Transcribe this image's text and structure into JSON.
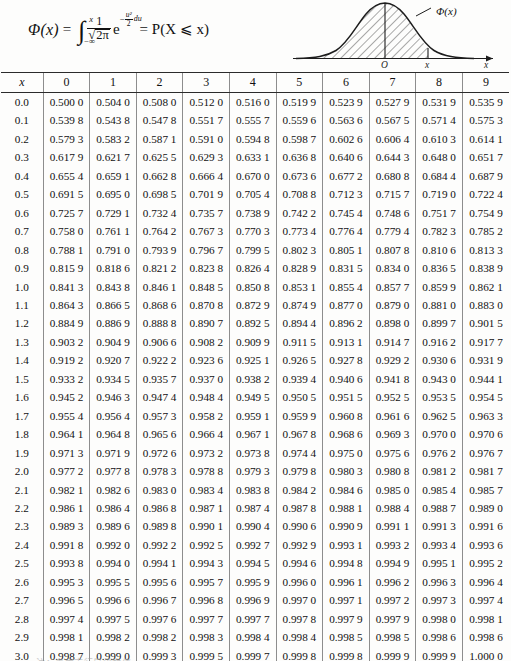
{
  "formula": {
    "lhs": "Φ(x)",
    "equals": "=",
    "integral_symbol": "∫",
    "limit_upper": "x",
    "limit_lower": "−∞",
    "fraction_numerator": "1",
    "fraction_denominator": "2π",
    "exponent_base": "e",
    "exponent_sign": "−",
    "exponent_numerator": "u²",
    "exponent_denominator": "2",
    "differential": "du",
    "rhs": "= P(X ⩽ x)",
    "full_text": "Φ(x) = ∫₋∞ˣ (1/√(2π)) e^(−u²/2) du = P(X ⩽ x)"
  },
  "figure": {
    "curve_label": "Φ(x)",
    "origin_label": "O",
    "x_label": "x",
    "axis_label": "x"
  },
  "table": {
    "corner_header": "x",
    "column_headers": [
      "0",
      "1",
      "2",
      "3",
      "4",
      "5",
      "6",
      "7",
      "8",
      "9"
    ],
    "rows": [
      {
        "x": "0.0",
        "values": [
          "0.500 0",
          "0.504 0",
          "0.508 0",
          "0.512 0",
          "0.516 0",
          "0.519 9",
          "0.523 9",
          "0.527 9",
          "0.531 9",
          "0.535 9"
        ]
      },
      {
        "x": "0.1",
        "values": [
          "0.539 8",
          "0.543 8",
          "0.547 8",
          "0.551 7",
          "0.555 7",
          "0.559 6",
          "0.563 6",
          "0.567 5",
          "0.571 4",
          "0.575 3"
        ]
      },
      {
        "x": "0.2",
        "values": [
          "0.579 3",
          "0.583 2",
          "0.587 1",
          "0.591 0",
          "0.594 8",
          "0.598 7",
          "0.602 6",
          "0.606 4",
          "0.610 3",
          "0.614 1"
        ]
      },
      {
        "x": "0.3",
        "values": [
          "0.617 9",
          "0.621 7",
          "0.625 5",
          "0.629 3",
          "0.633 1",
          "0.636 8",
          "0.640 6",
          "0.644 3",
          "0.648 0",
          "0.651 7"
        ]
      },
      {
        "x": "0.4",
        "values": [
          "0.655 4",
          "0.659 1",
          "0.662 8",
          "0.666 4",
          "0.670 0",
          "0.673 6",
          "0.677 2",
          "0.680 8",
          "0.684 4",
          "0.687 9"
        ]
      },
      {
        "x": "0.5",
        "values": [
          "0.691 5",
          "0.695 0",
          "0.698 5",
          "0.701 9",
          "0.705 4",
          "0.708 8",
          "0.712 3",
          "0.715 7",
          "0.719 0",
          "0.722 4"
        ]
      },
      {
        "x": "0.6",
        "values": [
          "0.725 7",
          "0.729 1",
          "0.732 4",
          "0.735 7",
          "0.738 9",
          "0.742 2",
          "0.745 4",
          "0.748 6",
          "0.751 7",
          "0.754 9"
        ]
      },
      {
        "x": "0.7",
        "values": [
          "0.758 0",
          "0.761 1",
          "0.764 2",
          "0.767 3",
          "0.770 3",
          "0.773 4",
          "0.776 4",
          "0.779 4",
          "0.782 3",
          "0.785 2"
        ]
      },
      {
        "x": "0.8",
        "values": [
          "0.788 1",
          "0.791 0",
          "0.793 9",
          "0.796 7",
          "0.799 5",
          "0.802 3",
          "0.805 1",
          "0.807 8",
          "0.810 6",
          "0.813 3"
        ]
      },
      {
        "x": "0.9",
        "values": [
          "0.815 9",
          "0.818 6",
          "0.821 2",
          "0.823 8",
          "0.826 4",
          "0.828 9",
          "0.831 5",
          "0.834 0",
          "0.836 5",
          "0.838 9"
        ]
      },
      {
        "x": "1.0",
        "values": [
          "0.841 3",
          "0.843 8",
          "0.846 1",
          "0.848 5",
          "0.850 8",
          "0.853 1",
          "0.855 4",
          "0.857 7",
          "0.859 9",
          "0.862 1"
        ]
      },
      {
        "x": "1.1",
        "values": [
          "0.864 3",
          "0.866 5",
          "0.868 6",
          "0.870 8",
          "0.872 9",
          "0.874 9",
          "0.877 0",
          "0.879 0",
          "0.881 0",
          "0.883 0"
        ]
      },
      {
        "x": "1.2",
        "values": [
          "0.884 9",
          "0.886 9",
          "0.888 8",
          "0.890 7",
          "0.892 5",
          "0.894 4",
          "0.896 2",
          "0.898 0",
          "0.899 7",
          "0.901 5"
        ]
      },
      {
        "x": "1.3",
        "values": [
          "0.903 2",
          "0.904 9",
          "0.906 6",
          "0.908 2",
          "0.909 9",
          "0.911 5",
          "0.913 1",
          "0.914 7",
          "0.916 2",
          "0.917 7"
        ]
      },
      {
        "x": "1.4",
        "values": [
          "0.919 2",
          "0.920 7",
          "0.922 2",
          "0.923 6",
          "0.925 1",
          "0.926 5",
          "0.927 8",
          "0.929 2",
          "0.930 6",
          "0.931 9"
        ]
      },
      {
        "x": "1.5",
        "values": [
          "0.933 2",
          "0.934 5",
          "0.935 7",
          "0.937 0",
          "0.938 2",
          "0.939 4",
          "0.940 6",
          "0.941 8",
          "0.943 0",
          "0.944 1"
        ]
      },
      {
        "x": "1.6",
        "values": [
          "0.945 2",
          "0.946 3",
          "0.947 4",
          "0.948 4",
          "0.949 5",
          "0.950 5",
          "0.951 5",
          "0.952 5",
          "0.953 5",
          "0.954 5"
        ]
      },
      {
        "x": "1.7",
        "values": [
          "0.955 4",
          "0.956 4",
          "0.957 3",
          "0.958 2",
          "0.959 1",
          "0.959 9",
          "0.960 8",
          "0.961 6",
          "0.962 5",
          "0.963 3"
        ]
      },
      {
        "x": "1.8",
        "values": [
          "0.964 1",
          "0.964 8",
          "0.965 6",
          "0.966 4",
          "0.967 1",
          "0.967 8",
          "0.968 6",
          "0.969 3",
          "0.970 0",
          "0.970 6"
        ]
      },
      {
        "x": "1.9",
        "values": [
          "0.971 3",
          "0.971 9",
          "0.972 6",
          "0.973 2",
          "0.973 8",
          "0.974 4",
          "0.975 0",
          "0.975 6",
          "0.976 2",
          "0.976 7"
        ]
      },
      {
        "x": "2.0",
        "values": [
          "0.977 2",
          "0.977 8",
          "0.978 3",
          "0.978 8",
          "0.979 3",
          "0.979 8",
          "0.980 3",
          "0.980 8",
          "0.981 2",
          "0.981 7"
        ]
      },
      {
        "x": "2.1",
        "values": [
          "0.982 1",
          "0.982 6",
          "0.983 0",
          "0.983 4",
          "0.983 8",
          "0.984 2",
          "0.984 6",
          "0.985 0",
          "0.985 4",
          "0.985 7"
        ]
      },
      {
        "x": "2.2",
        "values": [
          "0.986 1",
          "0.986 4",
          "0.986 8",
          "0.987 1",
          "0.987 4",
          "0.987 8",
          "0.988 1",
          "0.988 4",
          "0.988 7",
          "0.989 0"
        ]
      },
      {
        "x": "2.3",
        "values": [
          "0.989 3",
          "0.989 6",
          "0.989 8",
          "0.990 1",
          "0.990 4",
          "0.990 6",
          "0.990 9",
          "0.991 1",
          "0.991 3",
          "0.991 6"
        ]
      },
      {
        "x": "2.4",
        "values": [
          "0.991 8",
          "0.992 0",
          "0.992 2",
          "0.992 5",
          "0.992 7",
          "0.992 9",
          "0.993 1",
          "0.993 2",
          "0.993 4",
          "0.993 6"
        ]
      },
      {
        "x": "2.5",
        "values": [
          "0.993 8",
          "0.994 0",
          "0.994 1",
          "0.994 3",
          "0.994 5",
          "0.994 6",
          "0.994 8",
          "0.994 9",
          "0.995 1",
          "0.995 2"
        ]
      },
      {
        "x": "2.6",
        "values": [
          "0.995 3",
          "0.995 5",
          "0.995 6",
          "0.995 7",
          "0.995 9",
          "0.996 0",
          "0.996 1",
          "0.996 2",
          "0.996 3",
          "0.996 4"
        ]
      },
      {
        "x": "2.7",
        "values": [
          "0.996 5",
          "0.996 6",
          "0.996 7",
          "0.996 8",
          "0.996 9",
          "0.997 0",
          "0.997 1",
          "0.997 2",
          "0.997 3",
          "0.997 4"
        ]
      },
      {
        "x": "2.8",
        "values": [
          "0.997 4",
          "0.997 5",
          "0.997 6",
          "0.997 7",
          "0.997 7",
          "0.997 8",
          "0.997 9",
          "0.997 9",
          "0.998 0",
          "0.998 1"
        ]
      },
      {
        "x": "2.9",
        "values": [
          "0.998 1",
          "0.998 2",
          "0.998 2",
          "0.998 3",
          "0.998 4",
          "0.998 4",
          "0.998 5",
          "0.998 5",
          "0.998 6",
          "0.998 6"
        ]
      },
      {
        "x": "3.0",
        "values": [
          "0.998 7",
          "0.999 0",
          "0.999 3",
          "0.999 5",
          "0.999 7",
          "0.999 8",
          "0.999 8",
          "0.999 9",
          "0.999 9",
          "1.000 0"
        ]
      }
    ]
  },
  "footnote": "注：表中末行是函数值"
}
